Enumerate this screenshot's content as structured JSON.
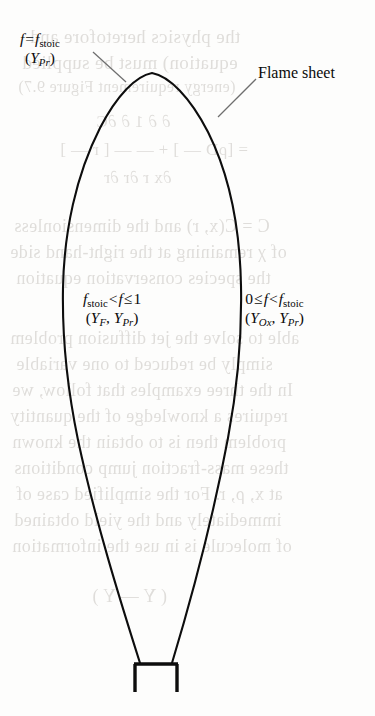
{
  "figure": {
    "type": "scientific-diagram",
    "background_color": "#fdfdfc",
    "ink_color": "#0a0a0a",
    "leader_color": "#6e6e6e"
  },
  "labels": {
    "stoichiometric": {
      "line1_f": "f",
      "line1_eq": "=",
      "line1_f2": "f",
      "line1_sub": "stoic",
      "line2_open": "(",
      "line2_Y": "Y",
      "line2_sub": "Pr",
      "line2_close": ")"
    },
    "flame_sheet": {
      "text": "Flame sheet"
    },
    "inner_region": {
      "line1_f1": "f",
      "line1_sub1": "stoic",
      "line1_lt": "<",
      "line1_f2": "f",
      "line1_le": "≤",
      "line1_val": "1",
      "line2_open": "(",
      "line2_Y1": "Y",
      "line2_sub1": "F",
      "line2_comma": ",",
      "line2_Y2": "Y",
      "line2_sub2": "Pr",
      "line2_close": ")"
    },
    "outer_region": {
      "line1_val": "0",
      "line1_le": "≤",
      "line1_f1": "f",
      "line1_lt": "<",
      "line1_f2": "f",
      "line1_sub2": "stoic",
      "line2_open": "(",
      "line2_Y1": "Y",
      "line2_sub1": "Ox",
      "line2_comma": ",",
      "line2_Y2": "Y",
      "line2_sub2": "Pr",
      "line2_close": ")"
    }
  },
  "bleed_through": [
    {
      "text": "the physics heretofore and",
      "x": 30,
      "y": 26,
      "size": 19
    },
    {
      "text": "equation) must be supplied",
      "x": 22,
      "y": 52,
      "size": 19
    },
    {
      "text": "(energy requirement Figure 9.7)",
      "x": 18,
      "y": 78,
      "size": 16
    },
    {
      "text": "∂ ∂ 1 ∂ ∂C",
      "x": 96,
      "y": 112,
      "size": 17
    },
    {
      "text": "= [ρD — ] + — — [ r — ]",
      "x": 60,
      "y": 140,
      "size": 17
    },
    {
      "text": "∂x r ∂r ∂r",
      "x": 104,
      "y": 168,
      "size": 17
    },
    {
      "text": "C = C(x, r) and the dimensionless",
      "x": 14,
      "y": 216,
      "size": 18
    },
    {
      "text": "of χ remaining at the right-hand side",
      "x": 10,
      "y": 242,
      "size": 18
    },
    {
      "text": "the species conservation equation",
      "x": 16,
      "y": 268,
      "size": 18
    },
    {
      "text": "able to solve the jet diffusion problem",
      "x": 10,
      "y": 328,
      "size": 18
    },
    {
      "text": "simply be reduced to one variable",
      "x": 16,
      "y": 354,
      "size": 18
    },
    {
      "text": "In the three examples that follow, we",
      "x": 12,
      "y": 380,
      "size": 18
    },
    {
      "text": "requires a knowledge of the quantity",
      "x": 10,
      "y": 406,
      "size": 18
    },
    {
      "text": "problem then is to obtain the known",
      "x": 12,
      "y": 432,
      "size": 18
    },
    {
      "text": "these mass-fraction jump conditions",
      "x": 14,
      "y": 458,
      "size": 18
    },
    {
      "text": "at x, ρ, r. For the simplified case of",
      "x": 16,
      "y": 484,
      "size": 18
    },
    {
      "text": "immediately and the yield obtained",
      "x": 14,
      "y": 510,
      "size": 18
    },
    {
      "text": "of molecule is in use the information",
      "x": 12,
      "y": 536,
      "size": 18
    },
    {
      "text": "( Y — Y )",
      "x": 92,
      "y": 586,
      "size": 18
    }
  ]
}
